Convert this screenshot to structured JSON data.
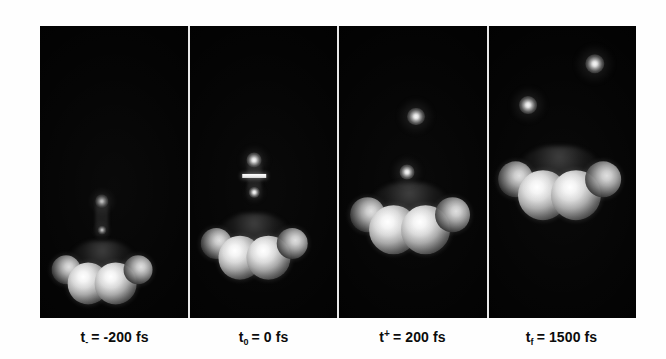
{
  "figure": {
    "kind": "time-resolved-molecular-dynamics-panels",
    "background_color": "#fefefe",
    "panel_background_color": "#000000",
    "divider_color": "#e9e9e9",
    "caption_color": "#0c0c0c",
    "panel_count": 4
  },
  "panels": [
    {
      "id": "panel-1",
      "caption": {
        "symbol": "t",
        "sub": "-",
        "sup": "",
        "equals": "=",
        "value": "-200 fs",
        "full_text": "t- = -200 fs"
      },
      "cluster": {
        "center_x_pct": 42,
        "center_y_pct": 83,
        "width_pct": 66,
        "height_pct": 26
      },
      "fragments": [
        {
          "x_pct": 42,
          "y_pct": 60,
          "size_pct": 9,
          "brightness": "dim"
        },
        {
          "x_pct": 42,
          "y_pct": 70,
          "size_pct": 6,
          "brightness": "dim"
        }
      ],
      "bond_bar": null
    },
    {
      "id": "panel-2",
      "caption": {
        "symbol": "t",
        "sub": "0",
        "sup": "",
        "equals": "=",
        "value": "0 fs",
        "full_text": "t0 = 0 fs"
      },
      "cluster": {
        "center_x_pct": 44,
        "center_y_pct": 74,
        "width_pct": 70,
        "height_pct": 27
      },
      "fragments": [
        {
          "x_pct": 44,
          "y_pct": 46,
          "size_pct": 10,
          "brightness": "bright"
        },
        {
          "x_pct": 44,
          "y_pct": 57,
          "size_pct": 7,
          "brightness": "bright"
        }
      ],
      "bond_bar": {
        "x_pct": 44,
        "y_pct": 51.5,
        "width_pct": 16,
        "height_pct": 1.4
      }
    },
    {
      "id": "panel-3",
      "caption": {
        "symbol": "t",
        "sub": "",
        "sup": "+",
        "equals": "=",
        "value": "200 fs",
        "full_text": "t+ = 200 fs"
      },
      "cluster": {
        "center_x_pct": 48,
        "center_y_pct": 64,
        "width_pct": 78,
        "height_pct": 29
      },
      "fragments": [
        {
          "x_pct": 52,
          "y_pct": 31,
          "size_pct": 12,
          "brightness": "bright"
        },
        {
          "x_pct": 46,
          "y_pct": 50,
          "size_pct": 10,
          "brightness": "bright"
        }
      ],
      "bond_bar": null
    },
    {
      "id": "panel-4",
      "caption": {
        "symbol": "t",
        "sub": "f",
        "sup": "",
        "equals": "=",
        "value": "1500 fs",
        "full_text": "tf = 1500 fs"
      },
      "cluster": {
        "center_x_pct": 48,
        "center_y_pct": 52,
        "width_pct": 80,
        "height_pct": 30
      },
      "fragments": [
        {
          "x_pct": 72,
          "y_pct": 13,
          "size_pct": 13,
          "brightness": "bright"
        },
        {
          "x_pct": 27,
          "y_pct": 27,
          "size_pct": 12,
          "brightness": "bright"
        }
      ],
      "bond_bar": null
    }
  ],
  "cluster_geometry": {
    "description": "four bright spheres, two large inner and two smaller outer half-lit, under a faint dark body",
    "spheres": [
      {
        "x_pct": 13,
        "y_pct": 52,
        "size_pct": 30,
        "style": "half"
      },
      {
        "x_pct": 36,
        "y_pct": 70,
        "size_pct": 42,
        "style": "full"
      },
      {
        "x_pct": 64,
        "y_pct": 70,
        "size_pct": 42,
        "style": "full"
      },
      {
        "x_pct": 87,
        "y_pct": 52,
        "size_pct": 30,
        "style": "half"
      }
    ]
  }
}
